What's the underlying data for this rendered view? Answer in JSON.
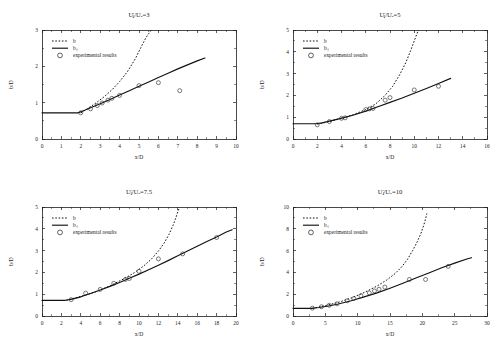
{
  "figure": {
    "background": "#ffffff",
    "ink": "#111111",
    "layout": "2x2 grid of line plots",
    "panel_count": 4
  },
  "legend_common": {
    "entries": [
      {
        "key": "b",
        "label": "b",
        "style": "dashed-line"
      },
      {
        "key": "bs",
        "label": "bₛ",
        "style": "solid-line"
      },
      {
        "key": "exp",
        "label": "experimental results",
        "style": "open-circle"
      }
    ]
  },
  "chart_data": [
    {
      "id": "panel-uj-ua-3",
      "type": "line",
      "title": "Uⱼ/Uₐ=3",
      "xlabel": "x/D",
      "ylabel": "b/D",
      "xlim": [
        0,
        10
      ],
      "ylim": [
        0,
        3
      ],
      "xticks": [
        0,
        1,
        2,
        3,
        4,
        5,
        6,
        7,
        8,
        9,
        10
      ],
      "yticks": [
        0,
        1,
        2,
        3
      ],
      "grid": false,
      "legend_position": "upper-left",
      "series": [
        {
          "name": "b",
          "style": "dashed",
          "x": [
            2.0,
            2.4,
            2.8,
            3.2,
            3.6,
            4.0,
            4.4,
            4.8,
            5.1,
            5.35,
            5.5,
            5.6,
            5.65
          ],
          "y": [
            0.72,
            0.85,
            1.0,
            1.16,
            1.35,
            1.58,
            1.85,
            2.2,
            2.52,
            2.78,
            2.9,
            2.97,
            3.0
          ]
        },
        {
          "name": "bs",
          "style": "solid",
          "x": [
            0.0,
            1.85,
            2.2,
            2.6,
            3.0,
            3.5,
            4.0,
            4.5,
            5.0,
            5.5,
            6.0,
            6.5,
            7.0,
            7.5,
            8.0,
            8.4
          ],
          "y": [
            0.72,
            0.72,
            0.79,
            0.88,
            0.97,
            1.09,
            1.21,
            1.33,
            1.45,
            1.57,
            1.69,
            1.81,
            1.93,
            2.04,
            2.15,
            2.23
          ]
        },
        {
          "name": "experimental results",
          "style": "markers",
          "x": [
            2.0,
            2.5,
            2.85,
            3.1,
            3.4,
            3.6,
            4.0,
            5.0,
            6.0,
            7.1
          ],
          "y": [
            0.72,
            0.83,
            0.92,
            0.99,
            1.07,
            1.12,
            1.2,
            1.47,
            1.55,
            1.33
          ]
        }
      ]
    },
    {
      "id": "panel-uj-ua-5",
      "type": "line",
      "title": "Uⱼ/Uₐ=5",
      "xlabel": "x/D",
      "ylabel": "b/D",
      "xlim": [
        0,
        16
      ],
      "ylim": [
        0,
        5
      ],
      "xticks": [
        0,
        2,
        4,
        6,
        8,
        10,
        12,
        14,
        16
      ],
      "yticks": [
        0,
        1,
        2,
        3,
        4,
        5
      ],
      "grid": false,
      "legend_position": "upper-left",
      "series": [
        {
          "name": "b",
          "style": "dashed",
          "x": [
            2.0,
            3.0,
            4.0,
            5.0,
            6.0,
            6.8,
            7.5,
            8.2,
            8.8,
            9.3,
            9.7,
            10.0,
            10.2,
            10.35
          ],
          "y": [
            0.68,
            0.8,
            0.95,
            1.12,
            1.35,
            1.6,
            1.95,
            2.4,
            2.95,
            3.5,
            4.05,
            4.5,
            4.8,
            5.0
          ]
        },
        {
          "name": "bs",
          "style": "solid",
          "x": [
            0.0,
            1.9,
            2.4,
            3.0,
            3.6,
            4.2,
            5.0,
            6.0,
            7.0,
            8.0,
            9.0,
            10.0,
            11.0,
            12.0,
            13.0
          ],
          "y": [
            0.7,
            0.7,
            0.74,
            0.82,
            0.9,
            0.98,
            1.1,
            1.28,
            1.48,
            1.68,
            1.88,
            2.1,
            2.32,
            2.55,
            2.78
          ]
        },
        {
          "name": "experimental results",
          "style": "markers",
          "x": [
            2.0,
            3.0,
            4.0,
            4.3,
            6.0,
            6.3,
            6.6,
            7.6,
            8.0,
            10.0,
            12.0
          ],
          "y": [
            0.65,
            0.8,
            0.95,
            0.97,
            1.35,
            1.38,
            1.4,
            1.78,
            1.9,
            2.25,
            2.42
          ]
        }
      ]
    },
    {
      "id": "panel-uj-ua-7-5",
      "type": "line",
      "title": "Uⱼ/Uₐ=7.5",
      "xlabel": "x/D",
      "ylabel": "b/D",
      "xlim": [
        0,
        20
      ],
      "ylim": [
        0,
        5
      ],
      "xticks": [
        0,
        2,
        4,
        6,
        8,
        10,
        12,
        14,
        16,
        18,
        20
      ],
      "yticks": [
        0,
        1,
        2,
        3,
        4,
        5
      ],
      "grid": false,
      "legend_position": "upper-left",
      "series": [
        {
          "name": "b",
          "style": "dashed",
          "x": [
            2.5,
            4.0,
            5.5,
            7.0,
            8.5,
            9.5,
            10.5,
            11.3,
            12.0,
            12.6,
            13.1,
            13.5,
            13.8,
            14.0,
            14.15
          ],
          "y": [
            0.72,
            0.9,
            1.1,
            1.38,
            1.72,
            1.98,
            2.3,
            2.62,
            2.98,
            3.35,
            3.75,
            4.15,
            4.5,
            4.78,
            4.95
          ]
        },
        {
          "name": "bs",
          "style": "solid",
          "x": [
            0.0,
            2.4,
            3.0,
            4.0,
            5.0,
            6.0,
            7.0,
            8.0,
            9.0,
            10.0,
            11.0,
            12.0,
            13.0,
            14.0,
            15.0,
            16.0,
            17.0,
            18.0,
            19.0,
            19.6
          ],
          "y": [
            0.72,
            0.72,
            0.76,
            0.88,
            1.03,
            1.19,
            1.36,
            1.54,
            1.73,
            1.92,
            2.12,
            2.33,
            2.54,
            2.76,
            2.98,
            3.2,
            3.42,
            3.62,
            3.85,
            3.96
          ]
        },
        {
          "name": "experimental results",
          "style": "markers",
          "x": [
            3.0,
            4.5,
            6.0,
            7.4,
            8.6,
            9.0,
            10.0,
            12.0,
            14.5,
            18.0
          ],
          "y": [
            0.75,
            1.05,
            1.22,
            1.5,
            1.68,
            1.72,
            2.05,
            2.62,
            2.85,
            3.6
          ]
        }
      ]
    },
    {
      "id": "panel-uj-ua-10",
      "type": "line",
      "title": "Uⱼ/Uₐ=10",
      "xlabel": "x/D",
      "ylabel": "b/D",
      "xlim": [
        0,
        30
      ],
      "ylim": [
        0,
        10
      ],
      "xticks": [
        0,
        5,
        10,
        15,
        20,
        25,
        30
      ],
      "yticks": [
        0,
        2,
        4,
        6,
        8,
        10
      ],
      "grid": false,
      "legend_position": "upper-left",
      "series": [
        {
          "name": "b",
          "style": "dashed",
          "x": [
            3.0,
            5.0,
            7.0,
            9.0,
            11.0,
            13.0,
            14.5,
            15.8,
            16.8,
            17.7,
            18.5,
            19.2,
            19.8,
            20.2,
            20.5,
            20.7
          ],
          "y": [
            0.7,
            0.95,
            1.25,
            1.65,
            2.15,
            2.75,
            3.3,
            3.9,
            4.5,
            5.2,
            6.0,
            6.8,
            7.6,
            8.3,
            8.9,
            9.4
          ]
        },
        {
          "name": "bs",
          "style": "solid",
          "x": [
            0.0,
            2.9,
            4.0,
            5.5,
            7.0,
            9.0,
            11.0,
            13.0,
            15.0,
            17.0,
            19.0,
            21.0,
            23.0,
            25.0,
            27.0,
            27.6
          ],
          "y": [
            0.7,
            0.7,
            0.78,
            0.92,
            1.1,
            1.4,
            1.75,
            2.12,
            2.55,
            3.0,
            3.48,
            3.95,
            4.42,
            4.85,
            5.25,
            5.35
          ]
        },
        {
          "name": "experimental results",
          "style": "markers",
          "x": [
            3.0,
            4.4,
            5.6,
            6.8,
            8.4,
            9.4,
            10.5,
            11.8,
            12.6,
            13.3,
            14.2,
            18.0,
            20.5,
            24.0
          ],
          "y": [
            0.72,
            0.85,
            0.98,
            1.12,
            1.4,
            1.6,
            1.85,
            2.12,
            2.3,
            2.45,
            2.65,
            3.35,
            3.35,
            4.55
          ]
        }
      ]
    }
  ]
}
